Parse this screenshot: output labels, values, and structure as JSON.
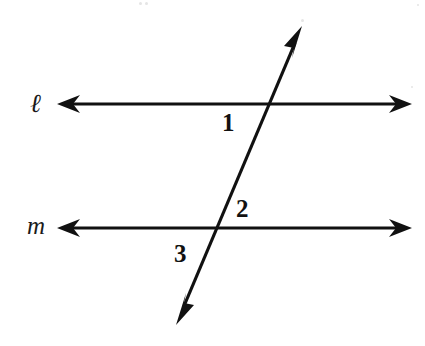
{
  "figure": {
    "type": "geometry-diagram",
    "background_color": "#ffffff",
    "stroke_color": "#111111"
  },
  "lines": [
    {
      "id": "line-l",
      "label": "ℓ",
      "label_x": 30,
      "label_y": 90,
      "orientation": "horizontal",
      "y": 104,
      "x_start": 57,
      "x_end": 412,
      "arrowheads": "both",
      "stroke_width": 3
    },
    {
      "id": "line-m",
      "label": "m",
      "label_x": 27,
      "label_y": 213,
      "orientation": "horizontal",
      "y": 228,
      "x_start": 57,
      "x_end": 412,
      "arrowheads": "both",
      "stroke_width": 3
    },
    {
      "id": "transversal",
      "label": "",
      "orientation": "diagonal",
      "x_start": 176,
      "y_start": 325,
      "x_end": 302,
      "y_end": 26,
      "arrowheads": "both",
      "stroke_width": 3
    }
  ],
  "intersections": [
    {
      "id": "intersection-l",
      "x": 265,
      "y": 104,
      "line": "ℓ"
    },
    {
      "id": "intersection-m",
      "x": 208,
      "y": 228,
      "line": "m"
    }
  ],
  "angle_labels": [
    {
      "id": "angle-1",
      "text": "1",
      "x": 222,
      "y": 110,
      "position": "below-left of intersection with line ℓ"
    },
    {
      "id": "angle-2",
      "text": "2",
      "x": 236,
      "y": 196,
      "position": "above-right of intersection with line m"
    },
    {
      "id": "angle-3",
      "text": "3",
      "x": 174,
      "y": 241,
      "position": "below-left of intersection with line m"
    }
  ],
  "scan_artifacts": [
    {
      "x": 139,
      "y": 2,
      "size": 3
    },
    {
      "x": 145,
      "y": 2,
      "size": 3
    },
    {
      "x": 301,
      "y": 19,
      "size": 3
    },
    {
      "x": 417,
      "y": 4,
      "size": 2
    },
    {
      "x": 411,
      "y": 86,
      "size": 2
    }
  ]
}
